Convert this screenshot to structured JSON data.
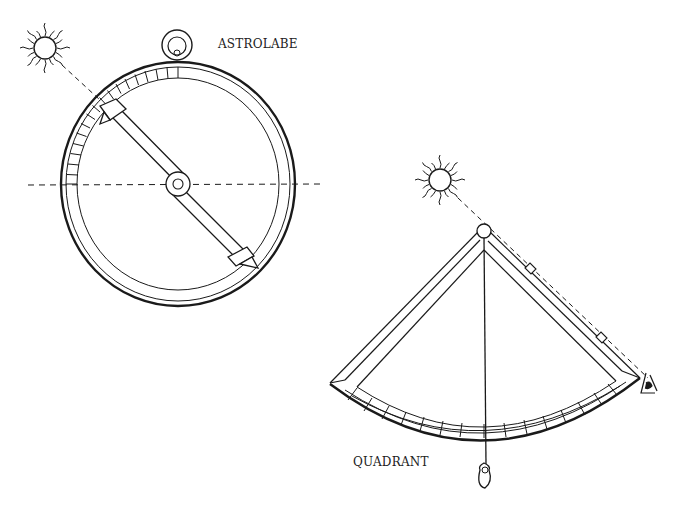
{
  "labels": {
    "astrolabe": "ASTROLABE",
    "quadrant": "QUADRANT"
  },
  "colors": {
    "ink": "#1a1a1a",
    "background": "#ffffff"
  },
  "icons": [
    "sun-icon",
    "sun-icon",
    "eye-icon",
    "plumb-bob-icon",
    "suspension-ring-icon"
  ]
}
